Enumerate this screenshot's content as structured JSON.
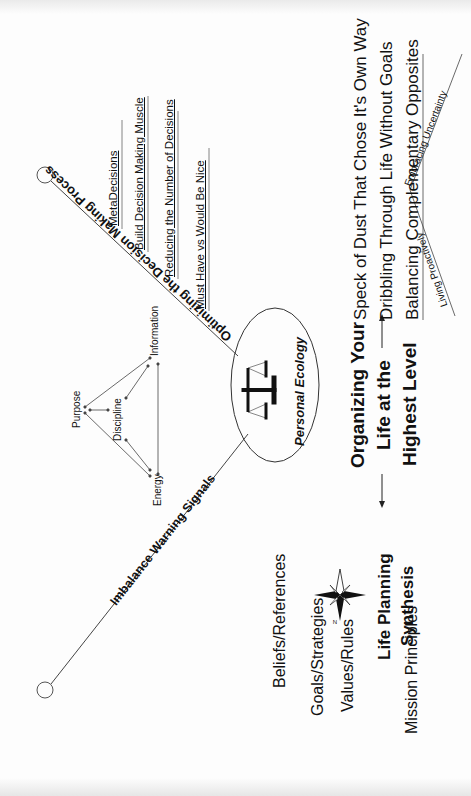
{
  "center": {
    "label": "Personal Ecology",
    "icon": "scales-of-justice-icon"
  },
  "branches": {
    "optimizing": {
      "label": "Optimizing the Decision Making Process",
      "items": [
        "MetaDecisions",
        "Build Decision Making  Muscle",
        "Reducing the Number of Decisions",
        "Must Have vs Would Be Nice"
      ]
    },
    "imbalance": {
      "label": "Imbalance Warning Signals"
    }
  },
  "triangle": {
    "nodes": [
      "Purpose",
      "Discipline",
      "Information",
      "Energy"
    ]
  },
  "organizing": {
    "title_lines": [
      "Organizing Your",
      "Life at the",
      "Highest Level"
    ],
    "items": [
      "Speck of Dust That Chose It's Own Way",
      "Dribbling Through Life Without Goals",
      "Balancing Complementary Opposites"
    ],
    "balance_branches": [
      "Living Proactively",
      "Embracing Uncertainty"
    ]
  },
  "life_planning": {
    "title_lines": [
      "Life Planning",
      "Synthesis"
    ],
    "compass_label": "N",
    "items": [
      "Beliefs/References",
      "Goals/Strategies",
      "Values/Rules",
      "Mission Principles"
    ]
  }
}
